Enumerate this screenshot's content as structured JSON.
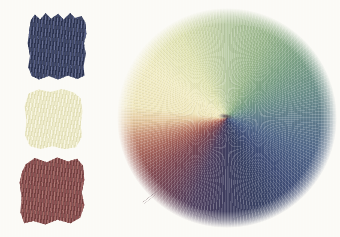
{
  "artwork": {
    "description": "Scanned colored-pencil study: three pigment swatches beside a blended color wheel",
    "paper_color": "#fbfaf6",
    "swatches": [
      {
        "id": "swatch-dark-blue",
        "label": "dark blue pigment swatch",
        "base": "#3e4667",
        "shade": "#2d3450",
        "tint": "#575f85"
      },
      {
        "id": "swatch-pale-yellow",
        "label": "pale yellow pigment swatch",
        "base": "#eeebcb",
        "shade": "#e2dfb8",
        "tint": "#f7f5e2"
      },
      {
        "id": "swatch-dark-red",
        "label": "dark red pigment swatch",
        "base": "#8c5051",
        "shade": "#73403f",
        "tint": "#a26863"
      }
    ],
    "wheel": {
      "label": "blended color wheel drawn in radiating pencil strokes",
      "center_dot": "rgba(68,52,66,0.75)",
      "segments": [
        {
          "deg": 0,
          "color": "#b7c9a2"
        },
        {
          "deg": 25,
          "color": "#9ab78d"
        },
        {
          "deg": 50,
          "color": "#7aa085"
        },
        {
          "deg": 72,
          "color": "#6b8f8a"
        },
        {
          "deg": 92,
          "color": "#5f7b8d"
        },
        {
          "deg": 112,
          "color": "#4f6588"
        },
        {
          "deg": 136,
          "color": "#414f78"
        },
        {
          "deg": 160,
          "color": "#394264"
        },
        {
          "deg": 182,
          "color": "#3f3d5f"
        },
        {
          "deg": 202,
          "color": "#50405f"
        },
        {
          "deg": 218,
          "color": "#6b4457"
        },
        {
          "deg": 233,
          "color": "#824a52"
        },
        {
          "deg": 247,
          "color": "#a5635a"
        },
        {
          "deg": 258,
          "color": "#c68d75"
        },
        {
          "deg": 267,
          "color": "#e2c39b"
        },
        {
          "deg": 277,
          "color": "#efe6bc"
        },
        {
          "deg": 303,
          "color": "#f1ecc4"
        },
        {
          "deg": 330,
          "color": "#e0e3b3"
        },
        {
          "deg": 360,
          "color": "#b7c9a2"
        }
      ]
    }
  }
}
